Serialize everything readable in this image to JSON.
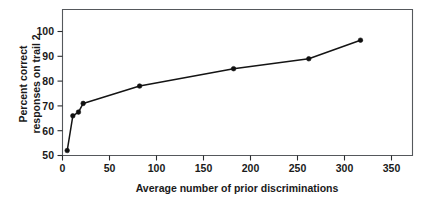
{
  "chart_data": {
    "type": "line",
    "title": "",
    "subtitle": "",
    "xlabel": "Average number of prior discriminations",
    "ylabel": "Percent correct responses on trail 2",
    "ylabel_line1": "Percent correct",
    "ylabel_line2": "responses on trail 2",
    "xlim": [
      0,
      370
    ],
    "ylim": [
      50,
      104
    ],
    "xticks": [
      0,
      50,
      100,
      150,
      200,
      250,
      300,
      350
    ],
    "xtick_labels": [
      "0",
      "50",
      "100",
      "150",
      "200",
      "250",
      "300",
      "350"
    ],
    "yticks": [
      50,
      60,
      70,
      80,
      90,
      100
    ],
    "ytick_labels": [
      "50",
      "60",
      "70",
      "80",
      "90",
      "100"
    ],
    "grid": false,
    "legend": null,
    "marker": "filled-circle",
    "line_color": "#141414",
    "marker_color": "#101010",
    "frame_color": "#55585c",
    "x": [
      5,
      11,
      17,
      22,
      82,
      182,
      262,
      317
    ],
    "values": [
      52,
      66,
      67.5,
      71,
      78,
      85,
      89,
      96.5
    ],
    "points": [
      {
        "x": 5,
        "y": 52
      },
      {
        "x": 11,
        "y": 66
      },
      {
        "x": 17,
        "y": 67.5
      },
      {
        "x": 22,
        "y": 71
      },
      {
        "x": 82,
        "y": 78
      },
      {
        "x": 182,
        "y": 85
      },
      {
        "x": 262,
        "y": 89
      },
      {
        "x": 317,
        "y": 96.5
      }
    ]
  },
  "axes": {
    "x_title": "Average number of prior discriminations",
    "y_title_line1": "Percent correct",
    "y_title_line2": "responses on trail 2"
  }
}
